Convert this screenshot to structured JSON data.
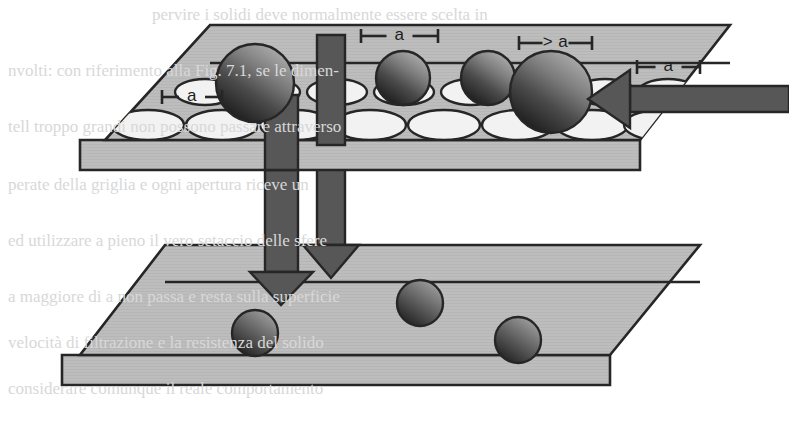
{
  "figure": {
    "type": "technical-diagram",
    "background_color": "#ffffff",
    "ink_color": "#262626",
    "plate_fill": "#bdbdbd",
    "plate_edge_fill": "#c6c6c6",
    "hole_fill": "#f2f2f2",
    "arrow_fill": "#575757",
    "sphere_light": "#9a9a9a",
    "sphere_dark": "#232323"
  },
  "labels": [
    {
      "id": "label-left-a",
      "text": "a",
      "x": 170,
      "y": 88,
      "tick_left": 162,
      "tick_right": 222
    },
    {
      "id": "label-top-a",
      "text": "a",
      "x": 370,
      "y": 27,
      "tick_left": 361,
      "tick_right": 438
    },
    {
      "id": "label-gt-a",
      "text": "> a",
      "x": 527,
      "y": 34,
      "tick_left": 519,
      "tick_right": 592
    },
    {
      "id": "label-right-a",
      "text": "a",
      "x": 645,
      "y": 58,
      "tick_left": 637,
      "tick_right": 700
    }
  ],
  "upper_plate": {
    "name": "perforated-sieve-plate",
    "top_face": "210,25 730,25 640,140 105,140",
    "front_edge": "80,140 640,140 640,170 80,170",
    "rows": [
      {
        "name": "hole-row-back",
        "cy": 92,
        "rx": 30,
        "ry": 13,
        "cx": [
          205,
          270,
          337,
          404,
          471,
          538,
          605,
          668
        ]
      },
      {
        "name": "hole-row-front",
        "cy": 125,
        "rx": 36,
        "ry": 15,
        "cx": [
          148,
          222,
          296,
          370,
          444,
          518,
          592,
          660
        ]
      }
    ]
  },
  "lower_plate": {
    "name": "solid-collector-plate",
    "top_face": "165,245 700,245 610,355 80,355",
    "front_edge": "62,355 610,355 610,385 62,385",
    "spheres": [
      {
        "name": "collected-sphere-1",
        "cx": 255,
        "cy": 333,
        "r": 23
      },
      {
        "name": "collected-sphere-2",
        "cx": 420,
        "cy": 303,
        "r": 23
      },
      {
        "name": "collected-sphere-3",
        "cx": 518,
        "cy": 340,
        "r": 23
      }
    ]
  },
  "spheres_on_plate": [
    {
      "name": "sphere-large-left",
      "cx": 255,
      "cy": 83,
      "r": 39,
      "note": "too-large-left"
    },
    {
      "name": "sphere-small-mid-1",
      "cx": 403,
      "cy": 78,
      "r": 27,
      "note": "fits-in-hole"
    },
    {
      "name": "sphere-small-mid-2",
      "cx": 488,
      "cy": 78,
      "r": 27,
      "note": "fits-in-hole"
    },
    {
      "name": "sphere-oversize",
      "cx": 551,
      "cy": 92,
      "r": 41,
      "note": "oversize-pushed"
    }
  ],
  "arrows": [
    {
      "name": "arrow-push-horizontal",
      "direction": "left",
      "shaft": "789,86 789,112 630,112 630,86",
      "head": "630,70 588,99 630,128"
    },
    {
      "name": "arrow-fall-left",
      "direction": "down",
      "shaft": "265,95 298,95 298,272 265,272",
      "head": "250,272 281,305 313,272"
    },
    {
      "name": "arrow-fall-right",
      "direction": "down",
      "shaft": "317,35 345,35 345,245 317,245",
      "head": "303,245 331,278 359,245"
    }
  ],
  "bars_through_plate": [
    {
      "name": "bar-left",
      "rect": "265,95 298,95 298,170 265,170"
    },
    {
      "name": "bar-right",
      "rect": "317,35 345,35 345,145 317,145"
    }
  ],
  "scan_bleed_text": [
    {
      "text": "pervire i solidi deve normalmente essere scelta in",
      "x": 152,
      "y": 6
    },
    {
      "text": "nvolti: con riferimento alla Fig. 7.1, se le dimen-",
      "x": 8,
      "y": 62
    },
    {
      "text": "tell troppo grandi non possono passare attraverso",
      "x": 8,
      "y": 118
    },
    {
      "text": "perate della griglia e ogni apertura riceve un",
      "x": 8,
      "y": 176
    },
    {
      "text": "ed utilizzare a pieno il vero setaccio delle sfere",
      "x": 8,
      "y": 232
    },
    {
      "text": "a maggiore di a non passa e resta sulla superficie",
      "x": 8,
      "y": 288
    },
    {
      "text": "velocità di filtrazione e la resistenza del solido",
      "x": 8,
      "y": 334
    },
    {
      "text": "considerare comunque il reale comportamento",
      "x": 8,
      "y": 380
    }
  ]
}
